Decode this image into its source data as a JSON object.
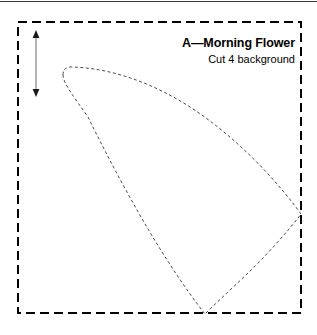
{
  "page": {
    "width": 317,
    "height": 335,
    "background_color": "#ffffff",
    "ink_color": "#000000"
  },
  "template": {
    "title": "A—Morning Flower",
    "subtitle": "Cut 4 background",
    "piece_letter": "A",
    "piece_name": "Morning Flower",
    "cut_count": "4",
    "fabric": "background"
  },
  "cutting_square": {
    "name": "dashed-square-boundary",
    "x": 17,
    "y": 21,
    "width": 285,
    "height": 293,
    "stroke_color": "#000000",
    "stroke_width": 2,
    "dash": "9 5"
  },
  "grain_arrow": {
    "name": "grain-line-double-arrow",
    "x": 36,
    "y_top": 32,
    "y_bottom": 95,
    "stroke_color": "#555555",
    "stroke_width": 1
  },
  "applique_shape": {
    "name": "petal-seam-line",
    "stroke_color": "#444444",
    "stroke_width": 1,
    "dash": "3 2.5",
    "start_point": [
      63,
      67
    ],
    "right_point": [
      302,
      215
    ],
    "bottom_point": [
      205,
      314
    ],
    "path": "M 63 74 Q 63 67 71 67 C 140 68 215 110 258 158 C 278 180 293 199 302 215 C 288 231 260 266 236 285 C 223 295 212 307 205 314 C 196 303 182 283 167 260 C 133 207 104 150 85 112 C 72 95 63 82 63 74 Z"
  }
}
